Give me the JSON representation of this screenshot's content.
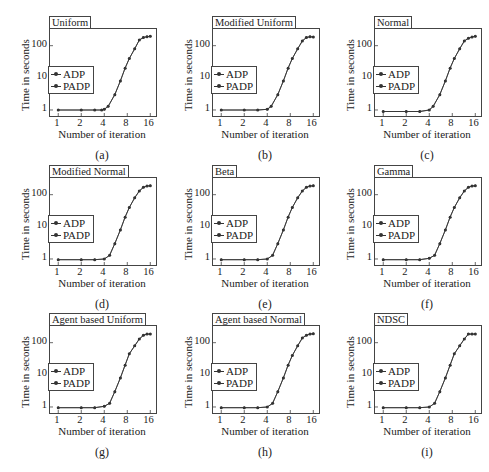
{
  "chart_data": [
    {
      "panel": "a",
      "type": "line",
      "title": "Uniform",
      "caption": "(a)",
      "xlabel": "Number of iteration",
      "ylabel": "Time in seconds",
      "xscale": "log2",
      "yscale": "log10",
      "xticks": [
        "1",
        "2",
        "4",
        "8",
        "16"
      ],
      "yticks": [
        "1",
        "10",
        "100"
      ],
      "legend": [
        "ADP",
        "PADP"
      ],
      "legend_position": "center-left",
      "series": [
        {
          "name": "ADP",
          "x": [
            1,
            2,
            3,
            3.7,
            4,
            4.5,
            5.5,
            6.5,
            7.5,
            8.5,
            10,
            11.5,
            13,
            14.5,
            16
          ],
          "y": [
            1,
            1,
            1,
            1,
            1.05,
            1.3,
            3,
            8,
            20,
            40,
            80,
            150,
            180,
            190,
            195
          ]
        },
        {
          "name": "PADP",
          "x": [
            1,
            2,
            3,
            3.7,
            4,
            4.5,
            5.5,
            6.5,
            7.5,
            8.5,
            10,
            11.5,
            13,
            14.5,
            16
          ],
          "y": [
            1,
            1,
            1,
            1,
            1.05,
            1.3,
            3,
            8,
            20,
            40,
            80,
            150,
            180,
            190,
            195
          ]
        }
      ]
    },
    {
      "panel": "b",
      "type": "line",
      "title": "Modified Uniform",
      "caption": "(b)",
      "xlabel": "Number of iteration",
      "ylabel": "Time in seconds",
      "xscale": "log2",
      "yscale": "log10",
      "xticks": [
        "1",
        "2",
        "4",
        "8",
        "16"
      ],
      "yticks": [
        "1",
        "10",
        "100"
      ],
      "legend": [
        "ADP",
        "PADP"
      ],
      "legend_position": "center-left",
      "series": [
        {
          "name": "ADP",
          "x": [
            1,
            2,
            3,
            4,
            4.5,
            5.5,
            6.5,
            7.5,
            8.5,
            10,
            11.5,
            13,
            14.5,
            16
          ],
          "y": [
            1,
            1,
            1,
            1.05,
            1.3,
            3,
            8,
            20,
            40,
            80,
            140,
            180,
            190,
            185
          ]
        },
        {
          "name": "PADP",
          "x": [
            1,
            2,
            3,
            4,
            4.5,
            5.5,
            6.5,
            7.5,
            8.5,
            10,
            11.5,
            13,
            14.5,
            16
          ],
          "y": [
            1,
            1,
            1,
            1.05,
            1.3,
            3,
            8,
            20,
            40,
            80,
            140,
            180,
            190,
            185
          ]
        }
      ]
    },
    {
      "panel": "c",
      "type": "line",
      "title": "Normal",
      "caption": "(c)",
      "xlabel": "Number of iteration",
      "ylabel": "Time in seconds",
      "xscale": "log2",
      "yscale": "log10",
      "xticks": [
        "1",
        "2",
        "4",
        "8",
        "16"
      ],
      "yticks": [
        "1",
        "10",
        "100"
      ],
      "legend": [
        "ADP",
        "PADP"
      ],
      "legend_position": "center-left",
      "series": [
        {
          "name": "ADP",
          "x": [
            1,
            2,
            3,
            4,
            4.5,
            5.5,
            6.5,
            7.5,
            8.5,
            10,
            11.5,
            13,
            14.5,
            16
          ],
          "y": [
            0.9,
            0.9,
            0.9,
            1,
            1.3,
            3,
            8,
            20,
            40,
            80,
            140,
            170,
            185,
            195
          ]
        },
        {
          "name": "PADP",
          "x": [
            1,
            2,
            3,
            4,
            4.5,
            5.5,
            6.5,
            7.5,
            8.5,
            10,
            11.5,
            13,
            14.5,
            16
          ],
          "y": [
            0.9,
            0.9,
            0.9,
            1,
            1.3,
            3,
            8,
            20,
            40,
            80,
            140,
            170,
            185,
            195
          ]
        }
      ]
    },
    {
      "panel": "d",
      "type": "line",
      "title": "Modified Normal",
      "caption": "(d)",
      "xlabel": "Number of iteration",
      "ylabel": "Time in seconds",
      "xscale": "log2",
      "yscale": "log10",
      "xticks": [
        "1",
        "2",
        "4",
        "8",
        "16"
      ],
      "yticks": [
        "1",
        "10",
        "100"
      ],
      "legend": [
        "ADP",
        "PADP"
      ],
      "legend_position": "center-left",
      "series": [
        {
          "name": "ADP",
          "x": [
            1,
            2,
            3,
            4,
            4.7,
            5.5,
            6.5,
            7.5,
            8.5,
            10,
            11.5,
            13,
            14.5,
            16
          ],
          "y": [
            0.95,
            0.95,
            0.95,
            1,
            1.3,
            3,
            8,
            20,
            40,
            80,
            130,
            170,
            185,
            190
          ]
        },
        {
          "name": "PADP",
          "x": [
            1,
            2,
            3,
            4,
            4.7,
            5.5,
            6.5,
            7.5,
            8.5,
            10,
            11.5,
            13,
            14.5,
            16
          ],
          "y": [
            0.95,
            0.95,
            0.95,
            1,
            1.3,
            3,
            8,
            20,
            40,
            80,
            130,
            170,
            185,
            190
          ]
        }
      ]
    },
    {
      "panel": "e",
      "type": "line",
      "title": "Beta",
      "caption": "(e)",
      "xlabel": "Number of iteration",
      "ylabel": "Time in seconds",
      "xscale": "log2",
      "yscale": "log10",
      "xticks": [
        "1",
        "2",
        "4",
        "8",
        "16"
      ],
      "yticks": [
        "1",
        "10",
        "100"
      ],
      "legend": [
        "ADP",
        "PADP"
      ],
      "legend_position": "center-left",
      "series": [
        {
          "name": "ADP",
          "x": [
            1,
            2,
            3,
            4,
            4.7,
            5.5,
            6.5,
            7.5,
            8.5,
            10,
            11.5,
            13,
            14.5,
            16
          ],
          "y": [
            0.95,
            0.95,
            0.95,
            1,
            1.3,
            3,
            8,
            20,
            40,
            80,
            130,
            170,
            185,
            190
          ]
        },
        {
          "name": "PADP",
          "x": [
            1,
            2,
            3,
            4,
            4.7,
            5.5,
            6.5,
            7.5,
            8.5,
            10,
            11.5,
            13,
            14.5,
            16
          ],
          "y": [
            0.95,
            0.95,
            0.95,
            1,
            1.3,
            3,
            8,
            20,
            40,
            80,
            130,
            170,
            185,
            190
          ]
        }
      ]
    },
    {
      "panel": "f",
      "type": "line",
      "title": "Gamma",
      "caption": "(f)",
      "xlabel": "Number of iteration",
      "ylabel": "Time in seconds",
      "xscale": "log2",
      "yscale": "log10",
      "xticks": [
        "1",
        "2",
        "4",
        "8",
        "16"
      ],
      "yticks": [
        "1",
        "10",
        "100"
      ],
      "legend": [
        "ADP",
        "PADP"
      ],
      "legend_position": "center-left",
      "series": [
        {
          "name": "ADP",
          "x": [
            1,
            2,
            3,
            4,
            4.7,
            5.5,
            6.5,
            7.5,
            8.5,
            10,
            11.5,
            13,
            14.5,
            16
          ],
          "y": [
            0.95,
            0.95,
            0.95,
            1.05,
            1.3,
            3,
            8,
            20,
            40,
            80,
            130,
            170,
            185,
            190
          ]
        },
        {
          "name": "PADP",
          "x": [
            1,
            2,
            3,
            4,
            4.7,
            5.5,
            6.5,
            7.5,
            8.5,
            10,
            11.5,
            13,
            14.5,
            16
          ],
          "y": [
            0.95,
            0.95,
            0.95,
            1.05,
            1.3,
            3,
            8,
            20,
            40,
            80,
            130,
            170,
            185,
            190
          ]
        }
      ]
    },
    {
      "panel": "g",
      "type": "line",
      "title": "Agent based Uniform",
      "caption": "(g)",
      "xlabel": "Number of iteration",
      "ylabel": "Time in seconds",
      "xscale": "log2",
      "yscale": "log10",
      "xticks": [
        "1",
        "2",
        "4",
        "8",
        "16"
      ],
      "yticks": [
        "1",
        "10",
        "100"
      ],
      "legend": [
        "ADP",
        "PADP"
      ],
      "legend_position": "center-left",
      "series": [
        {
          "name": "ADP",
          "x": [
            1,
            2,
            3,
            4,
            4.7,
            5.5,
            6.5,
            7.5,
            8.5,
            10,
            11.5,
            13,
            14.5,
            16
          ],
          "y": [
            0.95,
            0.95,
            0.95,
            1.05,
            1.3,
            3,
            8,
            20,
            45,
            80,
            130,
            170,
            185,
            185
          ]
        },
        {
          "name": "PADP",
          "x": [
            1,
            2,
            3,
            4,
            4.7,
            5.5,
            6.5,
            7.5,
            8.5,
            10,
            11.5,
            13,
            14.5,
            16
          ],
          "y": [
            0.95,
            0.95,
            0.95,
            1.05,
            1.3,
            3,
            8,
            20,
            45,
            80,
            130,
            170,
            185,
            185
          ]
        }
      ]
    },
    {
      "panel": "h",
      "type": "line",
      "title": "Agent based Normal",
      "caption": "(h)",
      "xlabel": "Number of iteration",
      "ylabel": "Time in seconds",
      "xscale": "log2",
      "yscale": "log10",
      "xticks": [
        "1",
        "2",
        "4",
        "8",
        "16"
      ],
      "yticks": [
        "1",
        "10",
        "100"
      ],
      "legend": [
        "ADP",
        "PADP"
      ],
      "legend_position": "center-left",
      "series": [
        {
          "name": "ADP",
          "x": [
            1,
            2,
            3,
            4,
            4.7,
            5.5,
            6.5,
            7.5,
            8.5,
            10,
            11.5,
            13,
            14.5,
            16
          ],
          "y": [
            0.95,
            0.95,
            0.95,
            1,
            1.3,
            3,
            8,
            20,
            40,
            80,
            140,
            170,
            185,
            190
          ]
        },
        {
          "name": "PADP",
          "x": [
            1,
            2,
            3,
            4,
            4.7,
            5.5,
            6.5,
            7.5,
            8.5,
            10,
            11.5,
            13,
            14.5,
            16
          ],
          "y": [
            0.95,
            0.95,
            0.95,
            1,
            1.3,
            3,
            8,
            20,
            40,
            80,
            140,
            170,
            185,
            190
          ]
        }
      ]
    },
    {
      "panel": "i",
      "type": "line",
      "title": "NDSC",
      "caption": "(i)",
      "xlabel": "Number of iteration",
      "ylabel": "Time in seconds",
      "xscale": "log2",
      "yscale": "log10",
      "xticks": [
        "1",
        "2",
        "4",
        "8",
        "16"
      ],
      "yticks": [
        "1",
        "10",
        "100"
      ],
      "legend": [
        "ADP",
        "PADP"
      ],
      "legend_position": "center-left",
      "series": [
        {
          "name": "ADP",
          "x": [
            1,
            2,
            3,
            4,
            4.7,
            5.5,
            6.5,
            7.5,
            8.5,
            10,
            11.5,
            13,
            14.5,
            16
          ],
          "y": [
            0.95,
            0.95,
            0.95,
            1,
            1.3,
            3,
            8,
            20,
            45,
            80,
            130,
            185,
            185,
            185
          ]
        },
        {
          "name": "PADP",
          "x": [
            1,
            2,
            3,
            4,
            4.7,
            5.5,
            6.5,
            7.5,
            8.5,
            10,
            11.5,
            13,
            14.5,
            16
          ],
          "y": [
            0.95,
            0.95,
            0.95,
            1,
            1.3,
            3,
            8,
            20,
            45,
            80,
            130,
            185,
            185,
            185
          ]
        }
      ]
    }
  ]
}
